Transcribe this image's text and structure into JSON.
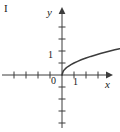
{
  "figure": {
    "panel_label": "I",
    "background_color": "#ffffff",
    "ink_color": "#3c3c3c",
    "text_color": "#1a1a1a",
    "width": 120,
    "height": 132
  },
  "axes": {
    "x_label": "x",
    "y_label": "y",
    "origin_label": "0",
    "x_tick_label": "1",
    "y_tick_label": "1",
    "origin_px": {
      "x": 62,
      "y": 75
    },
    "unit_px": 12
  },
  "chart_data": {
    "type": "line",
    "title": "",
    "subtitle": "",
    "xlabel": "x",
    "ylabel": "y",
    "annotations": [
      "I"
    ],
    "legend": [],
    "legend_position": "none",
    "grid": false,
    "xlim": [
      -5,
      4.6
    ],
    "ylim": [
      -5.3,
      4.8
    ],
    "xticks": [
      -4,
      -3,
      -2,
      -1,
      0,
      1,
      2,
      3
    ],
    "xticklabels": [
      "",
      "",
      "",
      "",
      "0",
      "1",
      "",
      ""
    ],
    "yticks": [
      -4,
      -3,
      -2,
      -1,
      0,
      1,
      2,
      3
    ],
    "yticklabels": [
      "",
      "",
      "",
      "",
      "0",
      "1",
      "",
      ""
    ],
    "series": [
      {
        "name": "y = sqrt(x)",
        "color": "#3c3c3c",
        "x": [
          0,
          0.1,
          0.2,
          0.35,
          0.5,
          0.75,
          1,
          1.3,
          1.6,
          2,
          2.4,
          2.8,
          3.2,
          3.6,
          4,
          4.4,
          4.8
        ],
        "y": [
          0,
          0.316,
          0.447,
          0.592,
          0.707,
          0.866,
          1,
          1.14,
          1.265,
          1.414,
          1.549,
          1.673,
          1.789,
          1.897,
          2,
          2.098,
          2.191
        ]
      }
    ]
  }
}
